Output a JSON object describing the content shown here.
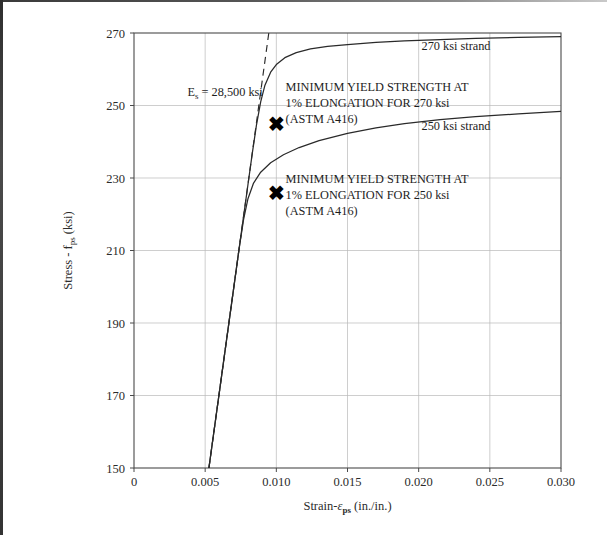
{
  "chart_data": {
    "type": "line",
    "title": "",
    "xlabel": "Strain-ε ps  (in./in.)",
    "ylabel": "Stress - f ps (ksi)",
    "xlim": [
      0,
      0.03
    ],
    "ylim": [
      150,
      270
    ],
    "grid": true,
    "legend_position": "inline-labels",
    "xticks": [
      0,
      0.005,
      0.01,
      0.015,
      0.02,
      0.025,
      0.03
    ],
    "xtick_labels": [
      "0",
      "0.005",
      "0.010",
      "0.015",
      "0.020",
      "0.025",
      "0.030"
    ],
    "yticks": [
      150,
      170,
      190,
      210,
      230,
      250,
      270
    ],
    "ytick_labels": [
      "150",
      "170",
      "190",
      "210",
      "230",
      "250",
      "270"
    ],
    "series": [
      {
        "name": "270 ksi strand",
        "points": [
          [
            0.005263,
            150
          ],
          [
            0.006,
            171
          ],
          [
            0.0065,
            185.3
          ],
          [
            0.007,
            199.5
          ],
          [
            0.0075,
            213.8
          ],
          [
            0.008,
            228.0
          ],
          [
            0.0083,
            236.5
          ],
          [
            0.0086,
            244.5
          ],
          [
            0.0089,
            251.0
          ],
          [
            0.0092,
            255.6
          ],
          [
            0.0096,
            259.2
          ],
          [
            0.01,
            261.3
          ],
          [
            0.0106,
            263.2
          ],
          [
            0.0114,
            264.6
          ],
          [
            0.0124,
            265.6
          ],
          [
            0.0136,
            266.3
          ],
          [
            0.015,
            266.8
          ],
          [
            0.017,
            267.4
          ],
          [
            0.019,
            267.8
          ],
          [
            0.0215,
            268.2
          ],
          [
            0.024,
            268.5
          ],
          [
            0.027,
            268.8
          ],
          [
            0.03,
            269.0
          ]
        ]
      },
      {
        "name": "250 ksi strand",
        "points": [
          [
            0.005263,
            150
          ],
          [
            0.006,
            171
          ],
          [
            0.0065,
            185.3
          ],
          [
            0.007,
            199.5
          ],
          [
            0.0074,
            210.9
          ],
          [
            0.0077,
            218.6
          ],
          [
            0.008,
            224.2
          ],
          [
            0.0084,
            228.6
          ],
          [
            0.0089,
            231.6
          ],
          [
            0.0096,
            234.2
          ],
          [
            0.0105,
            236.4
          ],
          [
            0.0116,
            238.4
          ],
          [
            0.013,
            240.3
          ],
          [
            0.015,
            242.3
          ],
          [
            0.017,
            243.8
          ],
          [
            0.019,
            245.0
          ],
          [
            0.0215,
            246.1
          ],
          [
            0.024,
            246.9
          ],
          [
            0.027,
            247.7
          ],
          [
            0.03,
            248.4
          ]
        ]
      }
    ],
    "modulus_line": {
      "label": "Es = 28,500 ksi",
      "label_main": "E",
      "label_sub": "s",
      "label_rest": " = 28,500 ksi",
      "value": 28500,
      "units": "ksi",
      "points": [
        [
          0.005263,
          150
        ],
        [
          0.00947,
          270
        ]
      ]
    },
    "markers": [
      {
        "name": "yield-marker-270",
        "glyph": "✖",
        "x": 0.01,
        "y": 245.0
      },
      {
        "name": "yield-marker-250",
        "glyph": "✖",
        "x": 0.01,
        "y": 226.0
      }
    ],
    "annotations": [
      {
        "name": "annotation-270",
        "lines": [
          "MINIMUM YIELD STRENGTH AT",
          "1% ELONGATION FOR 270 ksi",
          "(ASTM A416)"
        ],
        "x": 0.01065,
        "y": 254.0
      },
      {
        "name": "annotation-250",
        "lines": [
          "MINIMUM YIELD STRENGTH AT",
          "1% ELONGATION FOR 250 ksi",
          "(ASTM A416)"
        ],
        "x": 0.01065,
        "y": 228.5
      }
    ],
    "series_labels": [
      {
        "name": "label-270-strand",
        "text": "270 ksi strand",
        "x": 0.0202,
        "y": 265.2
      },
      {
        "name": "label-250-strand",
        "text": "250 ksi strand",
        "x": 0.0202,
        "y": 243.2
      }
    ],
    "axis_title_y_parts": {
      "main": "Stress - f",
      "sub": "ps",
      "rest": " (ksi)"
    },
    "axis_title_x_parts": {
      "main": "Strain-",
      "sym": "ε",
      "sub": "ps",
      "rest": "  (in./in.)"
    }
  }
}
